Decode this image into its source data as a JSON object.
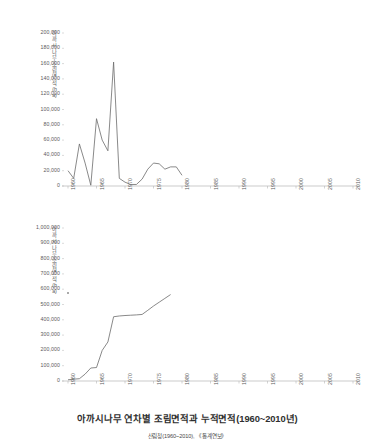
{
  "captions": {
    "main": "아까시나무 연차별 조림면적과 누적면적(1960~2010년)",
    "source": "산림청(1960~2010), 《통계연보》"
  },
  "axis_titles": {
    "top": "아까시나무 조림면적(ha)",
    "bottom": "아까시나무 조림면적(ha)"
  },
  "top_yticks": [
    "0",
    "20,000",
    "40,000",
    "60,000",
    "80,000",
    "100,000",
    "120,000",
    "140,000",
    "160,000",
    "180,000",
    "200,000"
  ],
  "bottom_yticks": [
    "0",
    "100,000",
    "200,000",
    "300,000",
    "400,000",
    "500,000",
    "600,000",
    "700,000",
    "800,000",
    "900,000",
    "1,000,000"
  ],
  "xticks": [
    "1960",
    "1965",
    "1970",
    "1975",
    "1980",
    "1985",
    "1990",
    "1995",
    "2000",
    "2005",
    "2010"
  ],
  "colors": {
    "line": "#6b6b6b",
    "axis": "#b5b5b5",
    "text": "#5a5a5a",
    "caption": "#2f2f2f",
    "background": "#ffffff"
  },
  "chart_data": [
    {
      "type": "line",
      "title": "아까시나무 연차별 조림면적과 누적면적(1960~2010년)",
      "subtitle": "연차별 조림면적",
      "xlabel": "",
      "ylabel": "아까시나무 조림면적(ha)",
      "xlim": [
        1960,
        2010
      ],
      "ylim": [
        0,
        200000
      ],
      "ytick_step": 20000,
      "xtick_step": 5,
      "grid": false,
      "legend": "none",
      "x": [
        1960,
        1961,
        1962,
        1963,
        1964,
        1965,
        1966,
        1967,
        1968,
        1969,
        1970,
        1971,
        1972,
        1973,
        1974,
        1975,
        1976,
        1977,
        1978,
        1979,
        1980
      ],
      "values": [
        20000,
        10000,
        55000,
        30000,
        1000,
        88000,
        60000,
        46000,
        162000,
        10000,
        5000,
        2000,
        2000,
        9000,
        22000,
        30000,
        29000,
        22000,
        25000,
        25000,
        14000
      ]
    },
    {
      "type": "line",
      "subtitle": "누적 조림면적",
      "xlabel": "",
      "ylabel": "아까시나무 조림면적(ha)",
      "xlim": [
        1960,
        2010
      ],
      "ylim": [
        0,
        1000000
      ],
      "ytick_step": 100000,
      "xtick_step": 5,
      "grid": false,
      "legend": "none",
      "x": [
        1960,
        1961,
        1962,
        1963,
        1964,
        1965,
        1966,
        1967,
        1968,
        1969,
        1970,
        1971,
        1972,
        1973,
        1974,
        1975,
        1976,
        1977,
        1978
      ],
      "values": [
        8000,
        12000,
        15000,
        45000,
        85000,
        88000,
        200000,
        255000,
        420000,
        425000,
        428000,
        430000,
        432000,
        435000,
        462000,
        490000,
        515000,
        540000,
        565000
      ]
    }
  ]
}
